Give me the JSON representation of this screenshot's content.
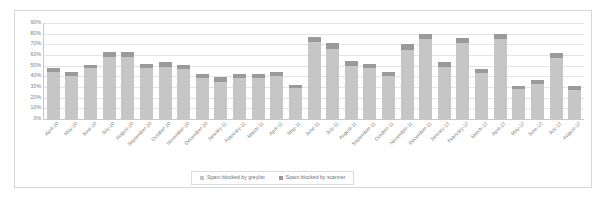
{
  "chart_data": {
    "type": "bar",
    "title": "",
    "subtitle": "",
    "xlabel": "",
    "ylabel": "",
    "stacked": true,
    "grid": true,
    "legend_position": "bottom",
    "ylim": [
      0,
      90
    ],
    "ytick_labels": [
      "90%",
      "80%",
      "70%",
      "60%",
      "50%",
      "40%",
      "30%",
      "20%",
      "10%",
      "0%"
    ],
    "ytick_values": [
      90,
      80,
      70,
      60,
      50,
      40,
      30,
      20,
      10,
      0
    ],
    "categories": [
      "April-10",
      "May-10",
      "June-10",
      "July-10",
      "August-10",
      "September-10",
      "October-10",
      "November-10",
      "December-10",
      "January-11",
      "February-11",
      "March-11",
      "April-11",
      "May-11",
      "June-11",
      "July-11",
      "August-11",
      "September-11",
      "October-11",
      "November-11",
      "December-11",
      "January-12",
      "February-12",
      "March-12",
      "April-12",
      "May-12",
      "June-12",
      "July-12",
      "August-12"
    ],
    "series": [
      {
        "name": "Spam blocked by greylist",
        "color": "#c6c6c6",
        "values": [
          44,
          40,
          48,
          58,
          58,
          48,
          49,
          47,
          38,
          35,
          38,
          38,
          40,
          29,
          72,
          66,
          50,
          48,
          40,
          65,
          75,
          49,
          71,
          43,
          75,
          28,
          33,
          57,
          27
        ]
      },
      {
        "name": "Spam blocked by scanner",
        "color": "#9a9a9a",
        "values": [
          4,
          4,
          3,
          5,
          5,
          4,
          4,
          4,
          4,
          4,
          4,
          4,
          4,
          3,
          5,
          5,
          4,
          4,
          4,
          5,
          5,
          4,
          5,
          4,
          5,
          3,
          4,
          5,
          4
        ]
      }
    ],
    "totals": [
      48,
      44,
      51,
      63,
      63,
      52,
      53,
      51,
      42,
      39,
      42,
      42,
      44,
      32,
      77,
      71,
      54,
      52,
      44,
      70,
      80,
      53,
      76,
      47,
      80,
      31,
      37,
      62,
      31
    ]
  },
  "legend": {
    "items": [
      {
        "label": "Spam blocked by greylist",
        "color": "#c6c6c6"
      },
      {
        "label": "Spam blocked by scanner",
        "color": "#9a9a9a"
      }
    ]
  }
}
